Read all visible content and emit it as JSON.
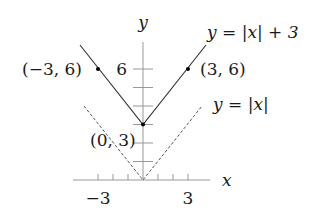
{
  "diagram": {
    "axes": {
      "x_label": "x",
      "y_label": "y",
      "x_tick_labels": [
        {
          "value": -3,
          "text": "−3"
        },
        {
          "value": 3,
          "text": "3"
        }
      ],
      "y_tick_labels": [
        {
          "value": 6,
          "text": "6"
        }
      ],
      "x_ticks": [
        -3,
        -2,
        -1,
        1,
        2,
        3
      ],
      "y_ticks": [
        1,
        2,
        3,
        4,
        5,
        6
      ]
    },
    "curves": [
      {
        "name": "shifted",
        "label": "y = |x| + 3",
        "style": "solid",
        "color": "#333333"
      },
      {
        "name": "base",
        "label": "y = |x|",
        "style": "dashed",
        "color": "#555555"
      }
    ],
    "points": [
      {
        "label": "(−3, 6)",
        "x": -3,
        "y": 6
      },
      {
        "label": "(3, 6)",
        "x": 3,
        "y": 6
      },
      {
        "label": "(0, 3)",
        "x": 0,
        "y": 3
      }
    ]
  }
}
